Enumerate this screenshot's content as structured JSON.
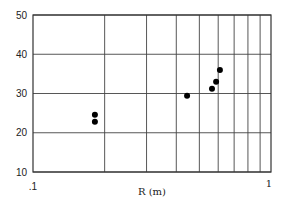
{
  "chart_data": {
    "type": "scatter",
    "title": "",
    "xlabel": "R (m)",
    "ylabel": "",
    "xscale": "log",
    "xlim": [
      0.1,
      1
    ],
    "ylim": [
      10,
      50
    ],
    "grid": true,
    "x_tick_labels": [
      ".1",
      "1"
    ],
    "x_minor_gridlines": [
      0.2,
      0.3,
      0.4,
      0.5,
      0.6,
      0.7,
      0.8,
      0.9
    ],
    "y_ticks": [
      10,
      20,
      30,
      40,
      50
    ],
    "y_tick_labels": [
      "10",
      "20",
      "30",
      "40",
      "50"
    ],
    "legend": null,
    "series": [
      {
        "name": "data",
        "marker": "filled-circle",
        "color": "#000000",
        "points": [
          {
            "x": 0.182,
            "y": 24.6
          },
          {
            "x": 0.182,
            "y": 22.8
          },
          {
            "x": 0.444,
            "y": 29.4
          },
          {
            "x": 0.565,
            "y": 31.2
          },
          {
            "x": 0.588,
            "y": 33.0
          },
          {
            "x": 0.61,
            "y": 36.0
          }
        ]
      }
    ]
  },
  "style": {
    "grid_color": "#444444",
    "axis_color": "#333333",
    "marker_color": "#000000"
  },
  "layout": {
    "plot_left": 33,
    "plot_right": 271,
    "plot_top": 15,
    "plot_bottom": 172
  }
}
